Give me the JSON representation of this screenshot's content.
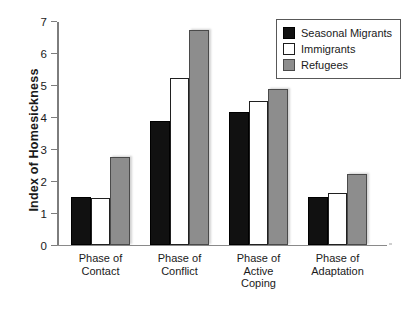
{
  "chart_data": {
    "type": "bar",
    "title": "",
    "xlabel": "",
    "ylabel": "Index of Homesickness",
    "ylim": [
      0,
      7
    ],
    "yticks": [
      "0",
      "1",
      "2",
      "3",
      "4",
      "5",
      "6",
      "7"
    ],
    "grid": false,
    "legend_position": "top-right",
    "categories": [
      "Phase of\nContact",
      "Phase of\nConflict",
      "Phase of\nActive\nCoping",
      "Phase of\nAdaptation"
    ],
    "series": [
      {
        "name": "Seasonal Migrants",
        "color": "#111111",
        "values": [
          1.5,
          3.85,
          4.15,
          1.5
        ]
      },
      {
        "name": "Immigrants",
        "color": "#ffffff",
        "values": [
          1.45,
          5.2,
          4.5,
          1.6
        ]
      },
      {
        "name": "Refugees",
        "color": "#8d8d8d",
        "values": [
          2.75,
          6.7,
          4.87,
          2.2
        ]
      }
    ]
  },
  "legend": {
    "items": [
      {
        "label": "Seasonal Migrants"
      },
      {
        "label": "Immigrants"
      },
      {
        "label": "Refugees"
      }
    ]
  }
}
